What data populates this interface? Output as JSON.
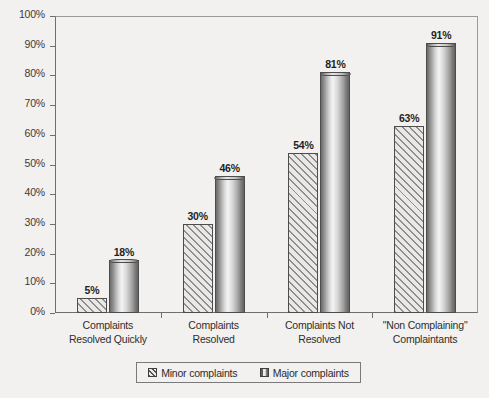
{
  "chart_data": {
    "type": "bar",
    "title": "",
    "xlabel": "",
    "ylabel": "",
    "ylim": [
      0,
      100
    ],
    "grid": false,
    "legend_position": "bottom",
    "categories": [
      "Complaints Resolved Quickly",
      "Complaints Resolved",
      "Complaints Not Resolved",
      "\"Non Complaining\" Complaintants"
    ],
    "category_lines": [
      [
        "Complaints",
        "Resolved Quickly"
      ],
      [
        "Complaints",
        "Resolved"
      ],
      [
        "Complaints Not",
        "Resolved"
      ],
      [
        "\"Non Complaining\"",
        "Complaintants"
      ]
    ],
    "series": [
      {
        "name": "Minor complaints",
        "style": "hatched",
        "values": [
          5,
          30,
          54,
          63
        ],
        "labels": [
          "5%",
          "30%",
          "54%",
          "63%"
        ]
      },
      {
        "name": "Major complaints",
        "style": "cylinder-gradient",
        "values": [
          18,
          46,
          81,
          91
        ],
        "labels": [
          "18%",
          "46%",
          "81%",
          "91%"
        ]
      }
    ],
    "y_ticks": [
      0,
      10,
      20,
      30,
      40,
      50,
      60,
      70,
      80,
      90,
      100
    ],
    "y_tick_labels": [
      "0%",
      "10%",
      "20%",
      "30%",
      "40%",
      "50%",
      "60%",
      "70%",
      "80%",
      "90%",
      "100%"
    ]
  },
  "legend": {
    "items": [
      {
        "label": "Minor complaints",
        "style": "minor"
      },
      {
        "label": "Major complaints",
        "style": "major"
      }
    ]
  },
  "colors": {
    "background": "#f2f1ef",
    "axis": "#6e6e6e",
    "text": "#2b2b2b",
    "bar_outline": "#4d4d4d",
    "hatch": "#8d8d8d"
  }
}
